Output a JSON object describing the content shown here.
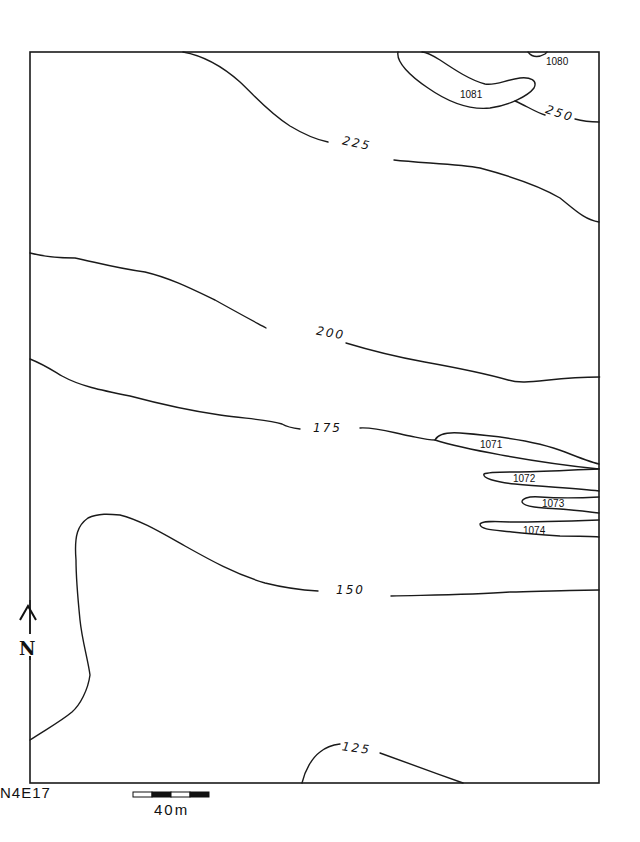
{
  "map": {
    "grid_label": "N4E17",
    "north_arrow_label": "N",
    "scale_bar": {
      "label": "40m",
      "segments": [
        "white",
        "black",
        "white",
        "black"
      ]
    },
    "contours": [
      {
        "value": "250",
        "type": "major"
      },
      {
        "value": "225",
        "type": "major"
      },
      {
        "value": "200",
        "type": "major"
      },
      {
        "value": "175",
        "type": "major"
      },
      {
        "value": "150",
        "type": "major"
      },
      {
        "value": "125",
        "type": "major"
      }
    ],
    "features": [
      {
        "label": "1080"
      },
      {
        "label": "1081"
      },
      {
        "label": "1071"
      },
      {
        "label": "1072"
      },
      {
        "label": "1073"
      },
      {
        "label": "1074"
      }
    ],
    "colors": {
      "ink": "#1a1a1a",
      "paper": "#ffffff"
    }
  }
}
